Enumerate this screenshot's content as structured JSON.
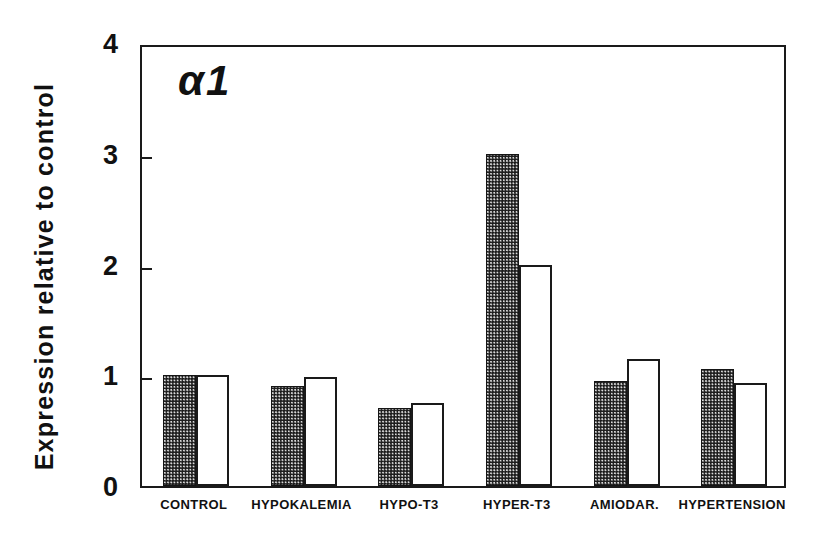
{
  "chart_data": {
    "type": "bar",
    "title": "",
    "panel_label": "α1",
    "xlabel": "",
    "ylabel": "Expression relative to control",
    "ylim": [
      0,
      4
    ],
    "yticks": [
      0,
      1,
      2,
      3,
      4
    ],
    "ytick_labels": [
      "0",
      "1",
      "2",
      "3",
      "4"
    ],
    "grid": false,
    "legend": "none",
    "categories": [
      "CONTROL",
      "HYPOKALEMIA",
      "HYPO-T3",
      "HYPER-T3",
      "AMIODAR.",
      "HYPERTENSION"
    ],
    "series": [
      {
        "name": "filled",
        "style": "solid-stippled-black",
        "values": [
          1.0,
          0.9,
          0.7,
          3.0,
          0.95,
          1.06
        ]
      },
      {
        "name": "open",
        "style": "white-outlined",
        "values": [
          1.0,
          0.98,
          0.75,
          2.0,
          1.15,
          0.93
        ]
      }
    ]
  },
  "colors": {
    "axis": "#1a1a1a",
    "text": "#111111",
    "filled_bar": "#1c1c1c",
    "open_bar": "#ffffff",
    "background": "#ffffff"
  }
}
